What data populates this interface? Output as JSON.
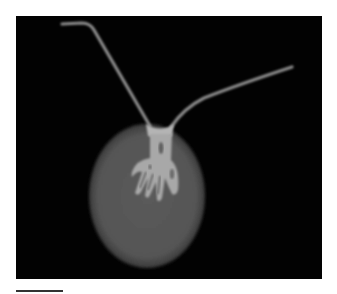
{
  "figure": {
    "background_color": "#020202",
    "panel": {
      "x": 16,
      "y": 16,
      "width": 306,
      "height": 263
    },
    "body": {
      "cx": 147,
      "cy": 196,
      "rx": 58,
      "ry": 72,
      "color": "#575757"
    },
    "structure_color": "#a8a8a8",
    "filament_color": "#8a8a8a"
  },
  "scale_bar": {
    "label": "",
    "x": 16,
    "y": 290,
    "length_px": 47,
    "color": "#333333"
  }
}
